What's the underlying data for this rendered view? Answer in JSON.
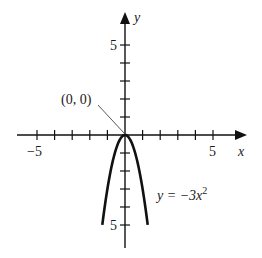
{
  "chart_data": {
    "type": "line",
    "title": "",
    "xlabel": "x",
    "ylabel": "y",
    "xlim": [
      -5.5,
      6.5
    ],
    "ylim": [
      -6.3,
      6.8
    ],
    "grid": false,
    "x_ticks": [
      -5,
      -4,
      -3,
      -2,
      -1,
      1,
      2,
      3,
      4,
      5
    ],
    "y_ticks": [
      -5,
      -4,
      -3,
      -2,
      -1,
      1,
      2,
      3,
      4,
      5
    ],
    "x_tick_labels": {
      "-5": "−5",
      "5": "5"
    },
    "y_tick_labels": {
      "5": "5",
      "-5": "5"
    },
    "series": [
      {
        "name": "y = −3x²",
        "equation": "y = -3x^2",
        "x": [
          -1.29,
          -1.0,
          -0.5,
          0,
          0.5,
          1.0,
          1.29
        ],
        "y": [
          -5,
          -3,
          -0.75,
          0,
          -0.75,
          -3,
          -5
        ],
        "color": "#111111"
      }
    ],
    "annotations": [
      {
        "text": "(0, 0)",
        "point": [
          0,
          0
        ]
      },
      {
        "text": "y = −3x",
        "superscript": "2",
        "near": [
          1.9,
          -3.6
        ]
      }
    ]
  },
  "labels": {
    "x_axis": "x",
    "y_axis": "y",
    "x_neg5": "−5",
    "x_pos5": "5",
    "y_pos5": "5",
    "y_neg5": "5",
    "vertex": "(0, 0)",
    "eq_main": "y = −3x",
    "eq_exp": "2"
  },
  "colors": {
    "axis": "#111111",
    "curve": "#111111",
    "leader": "#444444",
    "background": "#ffffff"
  }
}
